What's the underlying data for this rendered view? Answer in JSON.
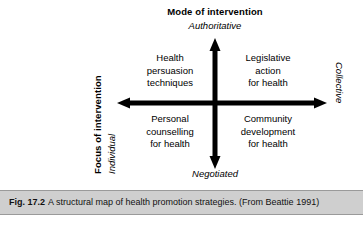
{
  "figure": {
    "caption_label": "Fig. 17.2",
    "caption_body": "A structural map of health promotion strategies. (From Beattie 1991)"
  },
  "diagram": {
    "type": "quadrant-matrix",
    "vertical_axis": {
      "title": "Mode of intervention",
      "top_pole": "Authoritative",
      "bottom_pole": "Negotiated"
    },
    "horizontal_axis": {
      "title": "Focus of intervention",
      "left_pole": "Individual",
      "right_pole": "Collective"
    },
    "quadrants": {
      "top_left": {
        "line1": "Health",
        "line2": "persuasion",
        "line3": "techniques"
      },
      "top_right": {
        "line1": "Legislative",
        "line2": "action",
        "line3": "for health"
      },
      "bottom_left": {
        "line1": "Personal",
        "line2": "counselling",
        "line3": "for health"
      },
      "bottom_right": {
        "line1": "Community",
        "line2": "development",
        "line3": "for health"
      }
    },
    "colors": {
      "axis": "#000000",
      "text": "#000000",
      "caption_bar": "#cfcfcf",
      "caption_border": "#9a9a9a",
      "background": "#ffffff"
    }
  }
}
